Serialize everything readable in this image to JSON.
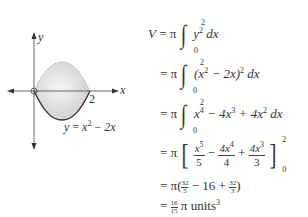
{
  "graph": {
    "x_axis_label": "x",
    "y_axis_label": "y",
    "tick_label_2": "2",
    "curve_label": "y = x² − 2x",
    "curve_label_parts": {
      "lhs": "y",
      "eq": "=",
      "x": "x",
      "exp": "2",
      "minus": "−",
      "term": "2x"
    },
    "colors": {
      "fill": "#dcdcdc",
      "curve": "#333333",
      "axis": "#444444"
    }
  },
  "derivation": {
    "lines": [
      {
        "lhs": "V",
        "eq": "= π",
        "lower": "0",
        "upper": "2",
        "integrand_base": "y",
        "integrand_exp": "2",
        "dx": "dx"
      },
      {
        "eq": "= π",
        "lower": "0",
        "upper": "2",
        "integrand_pre": "(x",
        "integrand_exp1": "2",
        "integrand_mid": " − 2x)",
        "integrand_exp2": "2",
        "dx": "dx"
      },
      {
        "eq": "= π",
        "lower": "0",
        "upper": "2",
        "t1": "x",
        "e1": "4",
        "t2": " − 4x",
        "e2": "3",
        "t3": " + 4x",
        "e3": "2",
        "dx": "dx"
      },
      {
        "eq": "= π",
        "f1n_base": "x",
        "f1n_exp": "5",
        "f1d": "5",
        "op1": "−",
        "f2n_base": "4x",
        "f2n_exp": "4",
        "f2d": "4",
        "op2": "+",
        "f3n_base": "4x",
        "f3n_exp": "3",
        "f3d": "3",
        "upper": "2",
        "lower": "0"
      },
      {
        "eq": "= π(",
        "f1n": "32",
        "f1d": "5",
        "mid": " − 16 + ",
        "f2n": "32",
        "f2d": "3",
        "close": ")"
      },
      {
        "eq": "=",
        "fn": "16",
        "fd": "15",
        "rest": "π units",
        "exp": "3"
      }
    ]
  }
}
